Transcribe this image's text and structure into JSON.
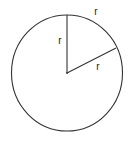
{
  "diagram": {
    "type": "radian-illustration",
    "stroke_color": "#333333",
    "background": "#ffffff",
    "circle": {
      "cx": 67,
      "cy": 73,
      "rx": 55.5,
      "ry": 58
    },
    "center_point": {
      "x": 67,
      "y": 73
    },
    "radius_vertical": {
      "x1": 67,
      "y1": 73,
      "x2": 67,
      "y2": 15
    },
    "radius_slanted": {
      "x1": 67,
      "y1": 73,
      "x2": 116,
      "y2": 48
    },
    "labels": {
      "vertical_radius": {
        "text": "r",
        "x": 60,
        "y": 44
      },
      "arc": {
        "text": "r",
        "x": 96,
        "y": 15
      },
      "slanted_radius": {
        "text": "r",
        "x": 98,
        "y": 70
      }
    }
  }
}
